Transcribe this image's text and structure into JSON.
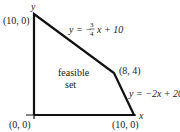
{
  "diagram": {
    "type": "feasible-region",
    "axes": {
      "x_label": "x",
      "y_label": "y"
    },
    "vertices": [
      {
        "id": "origin",
        "label": "(0, 0)"
      },
      {
        "id": "top",
        "label": "(10, 0)"
      },
      {
        "id": "corner",
        "label": "(8, 4)"
      },
      {
        "id": "right",
        "label": "(10, 0)"
      }
    ],
    "region_label_line1": "feasible",
    "region_label_line2": "set",
    "constraint_1": {
      "prefix": "y = −",
      "num": "3",
      "den": "4",
      "suffix": "x + 10"
    },
    "constraint_2": "y = −2x + 20"
  }
}
